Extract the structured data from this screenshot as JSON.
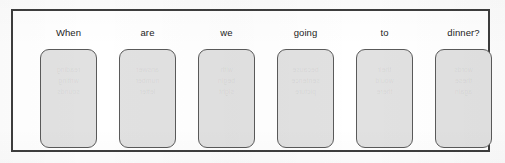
{
  "worksheet": {
    "title_text": "",
    "frame": {
      "border_color": "#3d3d3d",
      "background_color": "#ffffff"
    },
    "card_style": {
      "border_color": "#5a5a5a",
      "fill_color": "#e1e1e1",
      "label_color": "#232323"
    },
    "sentence": "When are we going to dinner?",
    "cards": [
      {
        "label": "When",
        "ghost": "reading\nwriting\nsounds"
      },
      {
        "label": "are",
        "ghost": "answer\nnumber\nletter"
      },
      {
        "label": "we",
        "ghost": "with\nbegin\nsight"
      },
      {
        "label": "going",
        "ghost": "because\nsentence\npicture"
      },
      {
        "label": "to",
        "ghost": "their\nwould\nthere"
      },
      {
        "label": "dinner?",
        "ghost": "words\nthese\nagain"
      }
    ]
  }
}
